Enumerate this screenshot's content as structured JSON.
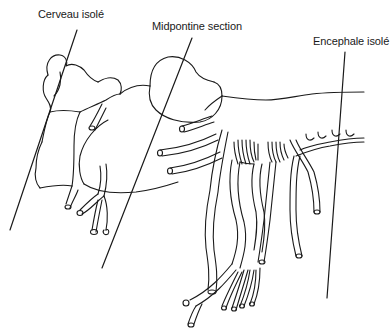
{
  "diagram": {
    "labels": [
      {
        "id": "cerveau-isole",
        "text": "Cerveau isolé"
      },
      {
        "id": "midpontine-section",
        "text": "Midpontine section"
      },
      {
        "id": "encephale-isole",
        "text": "Encephale isolé"
      }
    ],
    "colors": {
      "line": "#1a1a1a",
      "background": "#ffffff"
    }
  }
}
